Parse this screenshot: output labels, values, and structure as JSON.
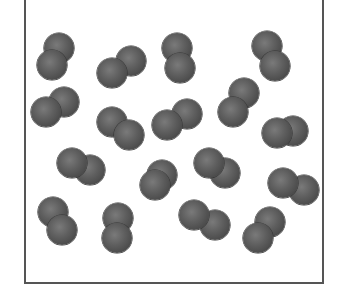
{
  "diagram": {
    "atom_color": "#555555",
    "atom_radius": 15,
    "molecules": [
      {
        "back": [
          59,
          48
        ],
        "front": [
          52,
          65
        ]
      },
      {
        "back": [
          131,
          61
        ],
        "front": [
          112,
          73
        ]
      },
      {
        "back": [
          64,
          102
        ],
        "front": [
          46,
          112
        ]
      },
      {
        "back": [
          112,
          122
        ],
        "front": [
          129,
          135
        ]
      },
      {
        "back": [
          177,
          48
        ],
        "front": [
          180,
          68
        ]
      },
      {
        "back": [
          267,
          46
        ],
        "front": [
          275,
          66
        ]
      },
      {
        "back": [
          244,
          93
        ],
        "front": [
          233,
          112
        ]
      },
      {
        "back": [
          187,
          114
        ],
        "front": [
          167,
          125
        ]
      },
      {
        "back": [
          293,
          131
        ],
        "front": [
          277,
          133
        ]
      },
      {
        "back": [
          90,
          170
        ],
        "front": [
          72,
          163
        ]
      },
      {
        "back": [
          162,
          175
        ],
        "front": [
          155,
          185
        ]
      },
      {
        "back": [
          53,
          212
        ],
        "front": [
          62,
          230
        ]
      },
      {
        "back": [
          118,
          218
        ],
        "front": [
          117,
          238
        ]
      },
      {
        "back": [
          225,
          173
        ],
        "front": [
          209,
          163
        ]
      },
      {
        "back": [
          304,
          190
        ],
        "front": [
          283,
          183
        ]
      },
      {
        "back": [
          215,
          225
        ],
        "front": [
          194,
          215
        ]
      },
      {
        "back": [
          270,
          222
        ],
        "front": [
          258,
          238
        ]
      }
    ]
  }
}
